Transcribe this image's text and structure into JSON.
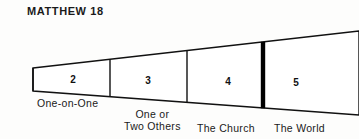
{
  "diagram": {
    "title": "MATTHEW 18",
    "type": "wedge-funnel",
    "colors": {
      "background": "#fdfdfc",
      "outline": "#111111",
      "emphasis_divider": "#000000",
      "text": "#1a1a1a"
    },
    "segments": [
      {
        "number": "2",
        "label_line1": "One-on-One",
        "label_line2": "",
        "num_x": 61,
        "num_y": 74,
        "label_x": 37,
        "label_y": 97
      },
      {
        "number": "3",
        "label_line1": "One or",
        "label_line2": "Two Others",
        "num_x": 136,
        "num_y": 75,
        "label_x": 124,
        "label_y": 108
      },
      {
        "number": "4",
        "label_line1": "The Church",
        "label_line2": "",
        "num_x": 216,
        "num_y": 76,
        "label_x": 197,
        "label_y": 122
      },
      {
        "number": "5",
        "label_line1": "The World",
        "label_line2": "",
        "num_x": 284,
        "num_y": 77,
        "label_x": 274,
        "label_y": 122
      }
    ],
    "geometry": {
      "top_edge": "M33,68 L359,31",
      "bottom_edge": "M33,91 L359,115",
      "left_edge": "M33,68 L33,91",
      "divider_1_x": 110,
      "divider_2_x": 187,
      "thick_divider_x": 263
    }
  }
}
